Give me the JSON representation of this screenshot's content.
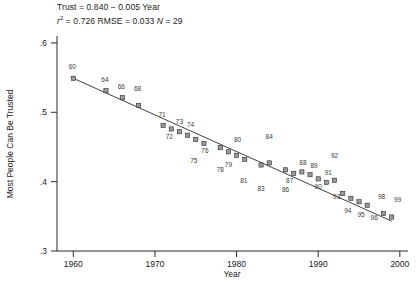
{
  "chart_data": {
    "type": "scatter",
    "title": "",
    "xlabel": "Year",
    "ylabel": "Most People Can Be Trusted",
    "xlim": [
      1958,
      2001
    ],
    "ylim": [
      0.3,
      0.61
    ],
    "xticks": [
      "1960",
      "1970",
      "1980",
      "1990",
      "2000"
    ],
    "xtick_values": [
      1960,
      1970,
      1980,
      1990,
      2000
    ],
    "yticks": [
      ".6",
      ".5",
      ".4",
      ".3"
    ],
    "ytick_values": [
      0.6,
      0.5,
      0.4,
      0.3
    ],
    "grid": false,
    "legend": false,
    "annotation_line1": "Trust = 0.840 − 0.005 Year",
    "annotation_line2_r2_label": "r",
    "annotation_line2_r2_sup": "2",
    "annotation_line2_r2_value": " = 0.726  ",
    "annotation_line2_rmse": "RMSE = 0.033  ",
    "annotation_line2_n_label": "N",
    "annotation_line2_n_value": " = 29",
    "fit": {
      "intercept": 0.84,
      "slope": -0.005,
      "r2": 0.726,
      "rmse": 0.033,
      "n": 29,
      "x_start": 1960,
      "x_end": 1999,
      "y_start": 0.549,
      "y_end": 0.343
    },
    "point_labels": [
      "60",
      "64",
      "66",
      "68",
      "71",
      "72",
      "73",
      "74",
      "75",
      "76",
      "78",
      "79",
      "80",
      "81",
      "83",
      "84",
      "86",
      "87",
      "88",
      "89",
      "90",
      "91",
      "92",
      "93",
      "94",
      "95",
      "96",
      "98",
      "99"
    ],
    "x": [
      1960,
      1964,
      1966,
      1968,
      1971,
      1972,
      1973,
      1974,
      1975,
      1976,
      1978,
      1979,
      1980,
      1981,
      1983,
      1984,
      1986,
      1987,
      1988,
      1989,
      1990,
      1991,
      1992,
      1993,
      1994,
      1995,
      1996,
      1998,
      1999
    ],
    "y": [
      0.549,
      0.531,
      0.521,
      0.51,
      0.481,
      0.476,
      0.472,
      0.467,
      0.461,
      0.455,
      0.449,
      0.443,
      0.438,
      0.432,
      0.424,
      0.427,
      0.417,
      0.412,
      0.414,
      0.41,
      0.404,
      0.399,
      0.402,
      0.383,
      0.376,
      0.371,
      0.366,
      0.354,
      0.349
    ],
    "label_offsets": [
      {
        "label": "60",
        "dx": -1,
        "dy": -9,
        "anchor": "middle"
      },
      {
        "label": "64",
        "dx": -1,
        "dy": -9,
        "anchor": "middle"
      },
      {
        "label": "66",
        "dx": -1,
        "dy": -9,
        "anchor": "middle"
      },
      {
        "label": "68",
        "dx": -1,
        "dy": -14,
        "anchor": "middle"
      },
      {
        "label": "71",
        "dx": -1,
        "dy": -8,
        "anchor": "middle"
      },
      {
        "label": "72",
        "dx": -2,
        "dy": 10,
        "anchor": "middle"
      },
      {
        "label": "73",
        "dx": 0,
        "dy": -8,
        "anchor": "middle"
      },
      {
        "label": "74",
        "dx": 3,
        "dy": -8,
        "anchor": "middle"
      },
      {
        "label": "75",
        "dx": -2,
        "dy": 24,
        "anchor": "middle"
      },
      {
        "label": "76",
        "dx": 1,
        "dy": 9,
        "anchor": "middle"
      },
      {
        "label": "78",
        "dx": 0,
        "dy": 24,
        "anchor": "middle"
      },
      {
        "label": "79",
        "dx": 0,
        "dy": 15,
        "anchor": "middle"
      },
      {
        "label": "80",
        "dx": 1,
        "dy": -13,
        "anchor": "middle"
      },
      {
        "label": "81",
        "dx": -1,
        "dy": 24,
        "anchor": "middle"
      },
      {
        "label": "83",
        "dx": 0,
        "dy": 26,
        "anchor": "middle"
      },
      {
        "label": "84",
        "dx": 0,
        "dy": -24,
        "anchor": "middle"
      },
      {
        "label": "86",
        "dx": 0,
        "dy": 22,
        "anchor": "middle"
      },
      {
        "label": "87",
        "dx": -4,
        "dy": 10,
        "anchor": "middle"
      },
      {
        "label": "88",
        "dx": 1,
        "dy": -7,
        "anchor": "middle"
      },
      {
        "label": "89",
        "dx": 4,
        "dy": -7,
        "anchor": "middle"
      },
      {
        "label": "90",
        "dx": 0,
        "dy": 10,
        "anchor": "middle"
      },
      {
        "label": "91",
        "dx": 2,
        "dy": -7,
        "anchor": "middle"
      },
      {
        "label": "92",
        "dx": 0,
        "dy": -22,
        "anchor": "middle"
      },
      {
        "label": "93",
        "dx": -6,
        "dy": 6,
        "anchor": "middle"
      },
      {
        "label": "94",
        "dx": -3,
        "dy": 15,
        "anchor": "middle"
      },
      {
        "label": "95",
        "dx": 2,
        "dy": 15,
        "anchor": "middle"
      },
      {
        "label": "96",
        "dx": 7,
        "dy": 15,
        "anchor": "middle"
      },
      {
        "label": "98",
        "dx": -2,
        "dy": -15,
        "anchor": "middle"
      },
      {
        "label": "99",
        "dx": 6,
        "dy": -15,
        "anchor": "middle"
      }
    ],
    "colors": {
      "marker_fill": "#9a9a9a",
      "marker_edge": "#2b2b2b",
      "line": "#2b2b2b",
      "axis": "#2b2b2b",
      "text": "#1a1a1a",
      "background": "#ffffff"
    }
  }
}
